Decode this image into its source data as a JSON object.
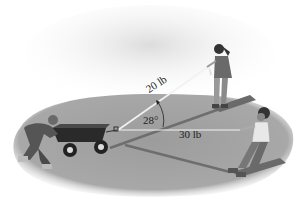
{
  "figure": {
    "forces": [
      {
        "label": "20 lb",
        "direction": "upper-right, toward girl"
      },
      {
        "label": "30 lb",
        "direction": "right, toward boy"
      }
    ],
    "angle": {
      "label": "28°"
    },
    "colors": {
      "ground": "#9a9a9a",
      "ground_dark": "#7a7a7a",
      "sky_haze": "#e6e6e6",
      "rope": "#f4f4f4",
      "text": "#222222"
    }
  }
}
